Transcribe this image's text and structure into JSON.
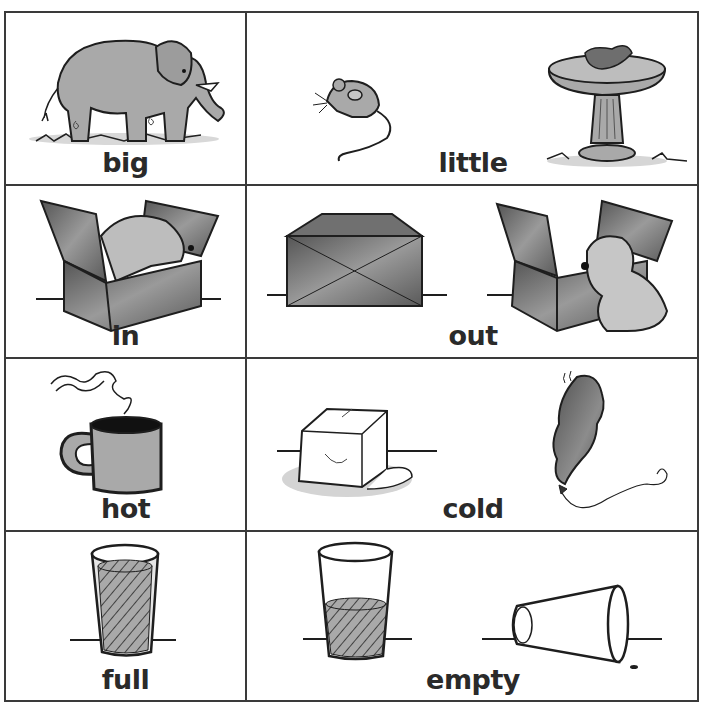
{
  "worksheet": {
    "title": "Opposites picture cards",
    "rows": [
      {
        "left": {
          "word": "big",
          "pictures": [
            "elephant"
          ]
        },
        "right": {
          "word": "little",
          "pictures": [
            "mouse",
            "bird-in-birdbath"
          ]
        }
      },
      {
        "left": {
          "word": "in",
          "pictures": [
            "puppy-in-box"
          ]
        },
        "right": {
          "word": "out",
          "pictures": [
            "closed-box",
            "puppy-beside-open-box"
          ]
        }
      },
      {
        "left": {
          "word": "hot",
          "pictures": [
            "steaming-mug"
          ]
        },
        "right": {
          "word": "cold",
          "pictures": [
            "melting-ice-cube",
            "balloon"
          ]
        }
      },
      {
        "left": {
          "word": "full",
          "pictures": [
            "full-glass"
          ]
        },
        "right": {
          "word": "empty",
          "pictures": [
            "half-glass",
            "tipped-empty-glass"
          ]
        }
      }
    ]
  },
  "colors": {
    "border": "#3a3a3a",
    "ink": "#1e1e1e",
    "fill_gray": "#a9a9a9",
    "fill_dark": "#6e6e6e",
    "label": "#2a2a2a"
  }
}
